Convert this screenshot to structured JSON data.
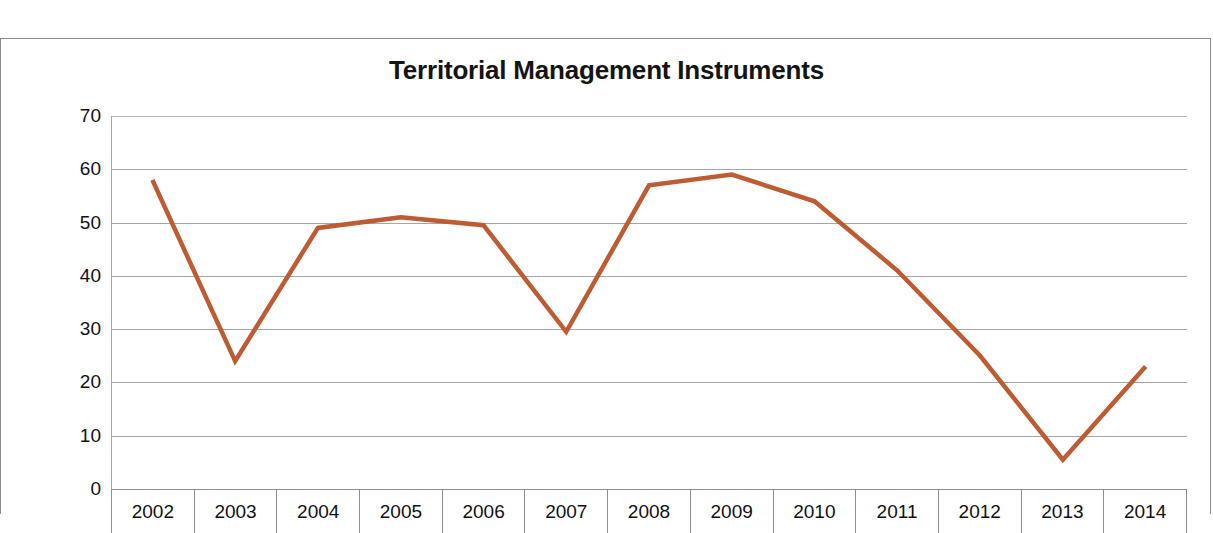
{
  "chart_data": {
    "type": "line",
    "title": "Territorial Management Instruments",
    "xlabel": "",
    "ylabel": "",
    "categories": [
      "2002",
      "2003",
      "2004",
      "2005",
      "2006",
      "2007",
      "2008",
      "2009",
      "2010",
      "2011",
      "2012",
      "2013",
      "2014"
    ],
    "values": [
      58,
      24,
      49,
      51,
      49.5,
      29.5,
      57,
      59,
      54,
      41,
      25,
      5.5,
      23
    ],
    "series": [
      {
        "name": "Territorial Management Instruments",
        "values": [
          58,
          24,
          49,
          51,
          49.5,
          29.5,
          57,
          59,
          54,
          41,
          25,
          5.5,
          23
        ],
        "color": "#BE5B32"
      }
    ],
    "ylim": [
      0,
      70
    ],
    "ytick_labels": [
      "70",
      "60",
      "50",
      "40",
      "30",
      "20",
      "10",
      "0"
    ],
    "ytick_values": [
      70,
      60,
      50,
      40,
      30,
      20,
      10,
      0
    ],
    "ytick_step": 10,
    "grid": true,
    "legend": "none",
    "line_color": "#BE5B32",
    "gridline_color": "#A6A6A6",
    "border_color": "#8C8C8C"
  }
}
